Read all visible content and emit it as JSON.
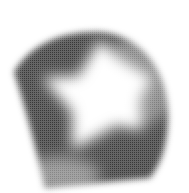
{
  "figure": {
    "background": "#ffffff",
    "shade_color": "#3a3a3a",
    "highlight_color": "#ffffff"
  }
}
